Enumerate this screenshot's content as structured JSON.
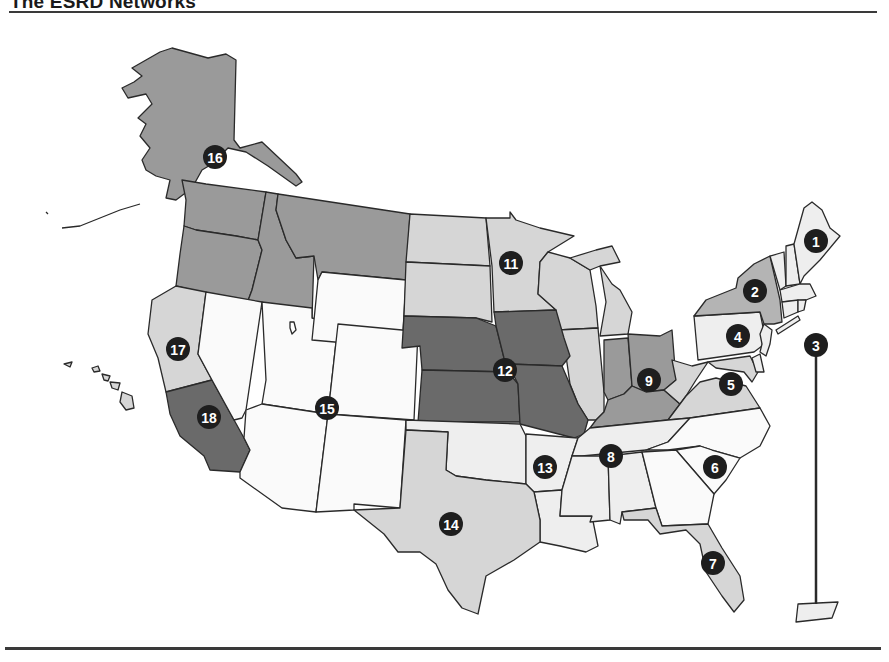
{
  "title": "The ESRD Networks",
  "shades": {
    "white": "#fafafa",
    "pale": "#eeeeee",
    "light": "#d6d6d6",
    "mid": "#b4b4b4",
    "mid_dark": "#9a9a9a",
    "dark": "#6a6a6a",
    "border": "#2a2a2a",
    "badge": "#1e1e1e"
  },
  "networks": [
    {
      "id": "1",
      "label": "1",
      "region": "New England (ME, NH, VT, MA, CT, RI)",
      "shade": "pale"
    },
    {
      "id": "2",
      "label": "2",
      "region": "New York",
      "shade": "mid"
    },
    {
      "id": "3",
      "label": "3",
      "region": "New Jersey, Puerto Rico",
      "shade": "pale"
    },
    {
      "id": "4",
      "label": "4",
      "region": "Pennsylvania, Delaware",
      "shade": "pale"
    },
    {
      "id": "5",
      "label": "5",
      "region": "Virginia, West Virginia, Maryland, DC",
      "shade": "light"
    },
    {
      "id": "6",
      "label": "6",
      "region": "North Carolina, South Carolina, Georgia",
      "shade": "white"
    },
    {
      "id": "7",
      "label": "7",
      "region": "Florida",
      "shade": "light"
    },
    {
      "id": "8",
      "label": "8",
      "region": "Tennessee, Alabama, Mississippi",
      "shade": "pale"
    },
    {
      "id": "9",
      "label": "9",
      "region": "Ohio, Indiana, Kentucky",
      "shade": "mid_dark"
    },
    {
      "id": "10",
      "label": "10",
      "region": "Illinois",
      "shade": "light"
    },
    {
      "id": "11",
      "label": "11",
      "region": "Upper Midwest (MN, ND, SD, WI, MI)",
      "shade": "light"
    },
    {
      "id": "12",
      "label": "12",
      "region": "Iowa, Kansas, Missouri, Nebraska",
      "shade": "dark"
    },
    {
      "id": "13",
      "label": "13",
      "region": "Arkansas, Louisiana, Oklahoma",
      "shade": "pale"
    },
    {
      "id": "14",
      "label": "14",
      "region": "Texas",
      "shade": "light"
    },
    {
      "id": "15",
      "label": "15",
      "region": "Mountain (AZ, CO, NV, NM, UT, WY)",
      "shade": "white"
    },
    {
      "id": "16",
      "label": "16",
      "region": "Northwest (AK, ID, MT, OR, WA)",
      "shade": "mid_dark"
    },
    {
      "id": "17",
      "label": "17",
      "region": "Northern California, Hawaii",
      "shade": "light"
    },
    {
      "id": "18",
      "label": "18",
      "region": "Southern California",
      "shade": "dark"
    }
  ],
  "badges": [
    {
      "label": "1",
      "x": 816,
      "y": 241
    },
    {
      "label": "2",
      "x": 755,
      "y": 291
    },
    {
      "label": "3",
      "x": 816,
      "y": 345
    },
    {
      "label": "4",
      "x": 738,
      "y": 336
    },
    {
      "label": "5",
      "x": 731,
      "y": 384
    },
    {
      "label": "6",
      "x": 715,
      "y": 467
    },
    {
      "label": "7",
      "x": 713,
      "y": 563
    },
    {
      "label": "8",
      "x": 611,
      "y": 456
    },
    {
      "label": "9",
      "x": 649,
      "y": 380
    },
    {
      "label": "11",
      "x": 511,
      "y": 263
    },
    {
      "label": "12",
      "x": 505,
      "y": 370
    },
    {
      "label": "13",
      "x": 545,
      "y": 467
    },
    {
      "label": "14",
      "x": 451,
      "y": 524
    },
    {
      "label": "15",
      "x": 327,
      "y": 408
    },
    {
      "label": "16",
      "x": 215,
      "y": 157
    },
    {
      "label": "17",
      "x": 178,
      "y": 349
    },
    {
      "label": "18",
      "x": 209,
      "y": 417
    }
  ]
}
